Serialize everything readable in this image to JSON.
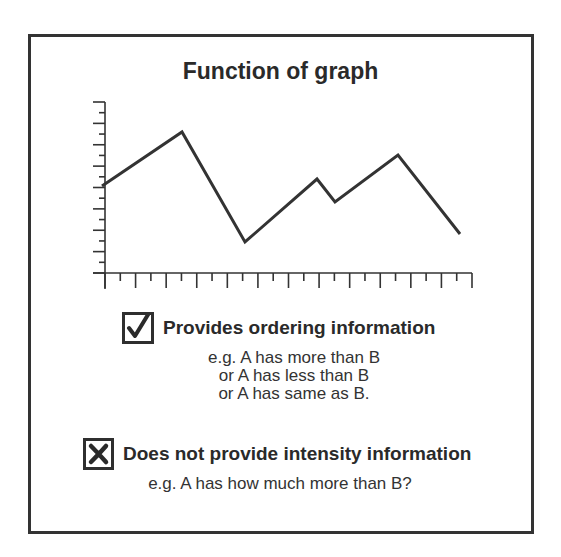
{
  "title": "Function of graph",
  "chart_data": {
    "type": "line",
    "title": "Function of graph",
    "xlabel": "",
    "ylabel": "",
    "grid": false,
    "axis": {
      "x_ticks": 25,
      "x_range": [
        0,
        24
      ],
      "y_ticks": 17,
      "y_range": [
        0,
        16
      ],
      "tick_labels": "none"
    },
    "series": [
      {
        "name": "function",
        "x": [
          0,
          5.2,
          9.4,
          14.1,
          15.3,
          19.4,
          23.5
        ],
        "y": [
          8.1,
          13.2,
          2.9,
          8.8,
          6.6,
          10.9,
          3.6
        ]
      }
    ]
  },
  "points_px": [
    [
      102,
      186
    ],
    [
      182,
      132
    ],
    [
      245,
      242
    ],
    [
      317,
      179
    ],
    [
      335,
      202
    ],
    [
      398,
      155
    ],
    [
      460,
      234
    ]
  ],
  "items": [
    {
      "icon": "checkmark-icon",
      "status": "yes",
      "heading": "Provides ordering information",
      "examples": [
        "e.g.  A has more than B",
        "or  A has less than B",
        "or  A has same as B."
      ]
    },
    {
      "icon": "cross-icon",
      "status": "no",
      "heading": "Does not provide intensity information",
      "examples": [
        "e.g.  A has how much more than B?"
      ]
    }
  ],
  "colors": {
    "ink": "#2a2a2a",
    "frame": "#333333",
    "background": "#ffffff"
  }
}
